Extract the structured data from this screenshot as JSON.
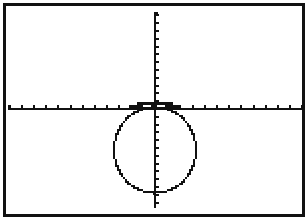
{
  "screen": {
    "type": "graphing-calculator-graph-screen",
    "background": "#ffffff",
    "ink": "#111111",
    "frame": {
      "x": 3,
      "y": 3,
      "width": 302,
      "height": 214,
      "stroke": 3
    }
  },
  "graph": {
    "x_axis": {
      "y": 108,
      "x_start": 8,
      "x_end": 302,
      "tick_spacing": 12.2,
      "tick_length": 3,
      "ticks_left": 12,
      "ticks_right": 12
    },
    "y_axis": {
      "x": 155,
      "y_start": 12,
      "y_end": 208,
      "tick_spacing": 7.8,
      "tick_length": 3
    },
    "curve": {
      "type": "circle",
      "center": {
        "x": 155,
        "y": 150
      },
      "rx": 41,
      "ry": 43,
      "style": "dotted-pixel"
    },
    "top_bump": {
      "x": 137,
      "y": 102,
      "width": 36,
      "height": 6
    }
  },
  "labels": {
    "description": "Circle graph below x-axis"
  }
}
